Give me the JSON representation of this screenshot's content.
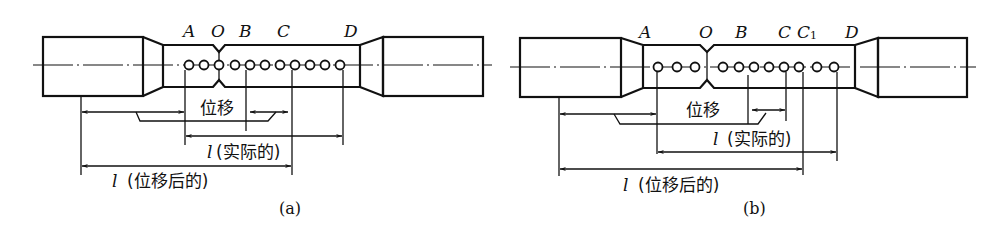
{
  "figure": {
    "panels": [
      {
        "id": "a",
        "caption": "(a)",
        "point_labels": {
          "A": "A",
          "O": "O",
          "B": "B",
          "C": "C",
          "D": "D"
        },
        "mark_count": 11,
        "dimension_labels": {
          "displacement": "位移",
          "l_symbol": "l",
          "actual": "(实际的)",
          "after_displacement": "(位移后的)"
        }
      },
      {
        "id": "b",
        "caption": "(b)",
        "point_labels": {
          "A": "A",
          "O": "O",
          "B": "B",
          "C": "C",
          "C1_main": "C",
          "C1_sub": "1",
          "D": "D"
        },
        "mark_count": 11,
        "dimension_labels": {
          "displacement": "位移",
          "l_symbol": "l",
          "actual": "(实际的)",
          "after_displacement": "(位移后的)"
        }
      }
    ],
    "colors": {
      "line": "#111111",
      "background": "#ffffff"
    }
  }
}
